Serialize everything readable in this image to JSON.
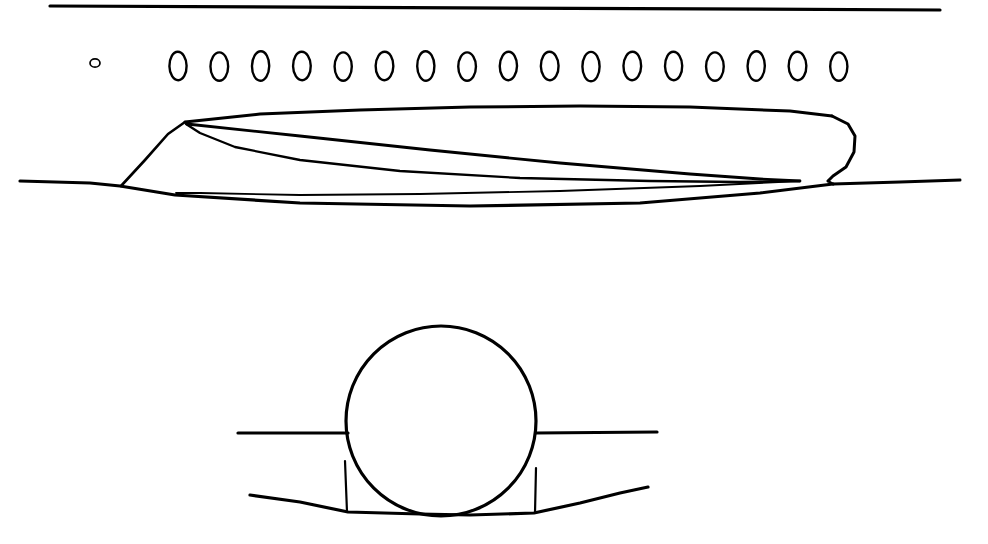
{
  "drawing": {
    "title": "Aircraft fuselage side view and cross-section line drawing",
    "style": "hand-drawn technical line art",
    "background_color": "#ffffff",
    "line_color": "#000000",
    "canvas": {
      "width": 988,
      "height": 544
    }
  },
  "side_view": {
    "name": "fuselage-side-view",
    "upper_reference_line": {
      "label": "upper horizontal reference line",
      "x1": 50,
      "y1": 6,
      "x2": 940,
      "y2": 10,
      "stroke_width": 3.2
    },
    "windows": {
      "label": "window row",
      "large_count": 17,
      "small_count": 1,
      "small_window": {
        "cx": 95,
        "cy": 63,
        "rx": 5.0,
        "ry": 4.2,
        "stroke_width": 1.7
      },
      "large_window": {
        "rx": 8.6,
        "ry": 14.2,
        "cy": 66,
        "stroke_width": 2.4
      },
      "large_first_cx": 178,
      "large_spacing": 41.3
    },
    "fuselage_upper_profile": {
      "label": "upper fuselage skin line",
      "points": "185,122 260,114 360,110 470,107 580,106 690,107 790,111 832,116"
    },
    "tail_cap": {
      "label": "rounded aft end cap",
      "points": "832,116 848,124 855,136 854,152 846,167 833,176 828,181"
    },
    "tail_notch": {
      "label": "aft lower notch",
      "points": "828,181 833,184"
    },
    "lower_skin_line": {
      "label": "lower fuselage / ground reference line",
      "points": "20,181 90,183 120,186 175,195 300,203 470,206 640,203 760,193 833,184"
    },
    "aft_extension_line": {
      "label": "aft extension line",
      "points": "833,184 900,182 960,180"
    },
    "nose_strut": {
      "label": "forward diagonal strut",
      "points": "121,186 145,160 168,134 185,122"
    },
    "wing_chord_upper": {
      "label": "wing upper chord line",
      "points": "187,124 300,136 430,150 560,163 690,174 760,179 800,181"
    },
    "wing_chord_lower": {
      "label": "wing lower chord curve",
      "points": "186,124 200,133 235,147 300,160 400,171 520,178 650,181 740,182 800,181"
    },
    "wing_inner_line": {
      "label": "wing inner fold line",
      "points": "800,181 700,186 560,191 420,194 300,195 200,193 176,193"
    }
  },
  "cross_section_view": {
    "name": "fuselage-cross-section-view",
    "fuselage_circle": {
      "label": "circular fuselage section",
      "cx": 441,
      "cy": 421,
      "r": 95,
      "stroke_width": 3.2
    },
    "wing_left": {
      "label": "left wing reference line",
      "x1": 238,
      "y1": 433,
      "x2": 348,
      "y2": 433,
      "stroke_width": 3.2
    },
    "wing_right": {
      "label": "right wing reference line",
      "x1": 536,
      "y1": 433,
      "x2": 657,
      "y2": 432,
      "stroke_width": 3.2
    },
    "strut_left": {
      "label": "left vertical strut",
      "x1": 345,
      "y1": 461,
      "x2": 347,
      "y2": 512,
      "stroke_width": 2.2
    },
    "strut_right": {
      "label": "right vertical strut",
      "x1": 536,
      "y1": 468,
      "x2": 535,
      "y2": 513,
      "stroke_width": 2.2
    },
    "lower_fairing": {
      "label": "lower belly fairing profile",
      "points": "250,495 300,502 348,512 420,514 470,515 534,513 580,503 620,493 648,487"
    }
  }
}
